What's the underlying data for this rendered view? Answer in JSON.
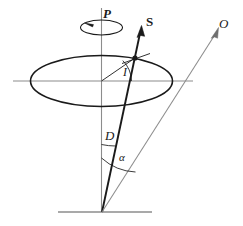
{
  "figure": {
    "background_color": "#ffffff",
    "ink_color": "#1a1a1a",
    "axis_color": "#8c8c8c",
    "labels": {
      "precession": "P",
      "spin_vector": "S",
      "observer": "O",
      "inclination_angle": "I",
      "axis_tilt_angle": "D",
      "aspect_angle": "α"
    },
    "elements": {
      "precession_circle": "small ellipse at top with counter-clockwise arrow",
      "main_disk": "large ellipse representing the precession cone base / disk",
      "vertical_axis": "vertical reference line through disk centre",
      "horizontal_axis": "horizontal reference line through disk centre",
      "spin_arrow": "bold arrow labelled S from cone apex through disk",
      "observer_arrow": "thin arrow labelled O from cone apex to upper right",
      "ground_line": "short horizontal line at the cone apex",
      "intersection_marker": "filled dot where S pierces the disk",
      "tangent_tick": "short tangent stroke at the intersection dot"
    }
  }
}
